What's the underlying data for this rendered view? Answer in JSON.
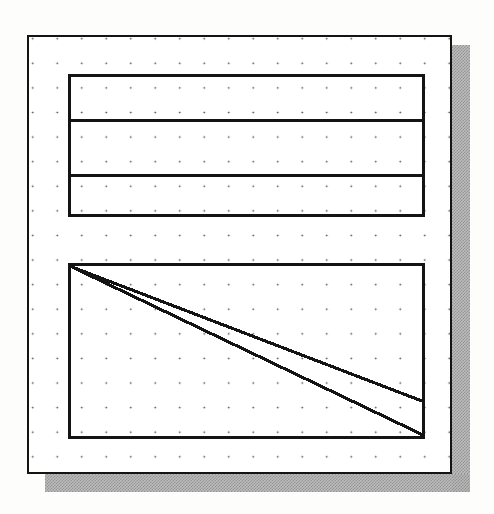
{
  "figure": {
    "title": "Schematic drawing: grid sheet with table block and line-graph block",
    "background_color": "#fdfdfc",
    "ink_color": "#141414",
    "paper_color": "#ffffff",
    "shadow_color": "#b9b9b9"
  },
  "canvas": {
    "label": "drawing-sheet",
    "frame_label": "outer-border",
    "grid": {
      "label": "dot-grid",
      "dot_color": "#4a4a4a",
      "spacing_x": 24.5,
      "spacing_y": 24.6,
      "columns": 17,
      "rows": 18
    },
    "shadow": {
      "right_label": "right-drop-shadow",
      "bottom_label": "bottom-drop-shadow",
      "offset": 18
    }
  },
  "table_block": {
    "label": "table-block",
    "row_count": 3,
    "rows": [
      {
        "label": "table-row-1",
        "text": ""
      },
      {
        "label": "table-row-2",
        "text": ""
      },
      {
        "label": "table-row-3",
        "text": ""
      }
    ],
    "dividers": [
      {
        "label": "table-divider-1"
      },
      {
        "label": "table-divider-2"
      }
    ]
  },
  "chart_block": {
    "label": "chart-block",
    "line_count": 2,
    "lines": [
      {
        "label": "upper-diagonal-line"
      },
      {
        "label": "lower-diagonal-line"
      }
    ]
  },
  "chart_data": {
    "type": "line",
    "title": "",
    "subtitle": "",
    "xlabel": "",
    "ylabel": "",
    "grid": true,
    "legend": null,
    "xlim": [
      0,
      100
    ],
    "ylim": [
      0,
      100
    ],
    "x": [
      0,
      100
    ],
    "series": [
      {
        "name": "upper-diagonal-line",
        "values": [
          100,
          20
        ]
      },
      {
        "name": "lower-diagonal-line",
        "values": [
          100,
          0
        ]
      }
    ],
    "annotations": []
  }
}
